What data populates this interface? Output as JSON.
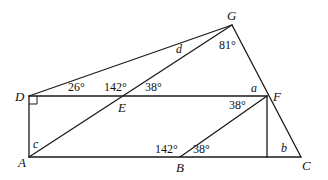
{
  "diagram": {
    "points": {
      "A": "A",
      "B": "B",
      "C": "C",
      "D": "D",
      "E": "E",
      "F": "F",
      "G": "G"
    },
    "angles": {
      "D_G": "26°",
      "E_left": "142°",
      "E_right": "38°",
      "G": "81°",
      "F_lower": "38°",
      "B_left": "142°",
      "B_right": "38°"
    },
    "unknowns": {
      "a": "a",
      "b": "b",
      "c": "c",
      "d": "d"
    },
    "right_angle_at": "D"
  }
}
